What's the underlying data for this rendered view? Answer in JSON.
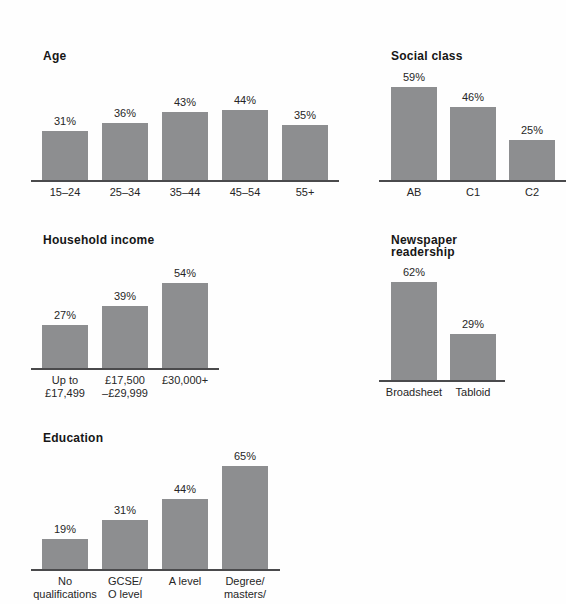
{
  "style": {
    "bar_color": "#8d8e90",
    "axis_color": "#4a4a4c",
    "text_color": "#262626",
    "title_color": "#161616",
    "background": "#fefefe"
  },
  "chart_data": [
    {
      "type": "bar",
      "title": "Age",
      "categories": [
        "15–24",
        "25–34",
        "35–44",
        "45–54",
        "55+"
      ],
      "values": [
        31,
        36,
        43,
        44,
        35
      ],
      "value_labels": [
        "31%",
        "36%",
        "43%",
        "44%",
        "35%"
      ],
      "unit": "%",
      "grid": false,
      "legend": "none"
    },
    {
      "type": "bar",
      "title": "Social class",
      "categories": [
        "AB",
        "C1",
        "C2"
      ],
      "values": [
        59,
        46,
        25
      ],
      "value_labels": [
        "59%",
        "46%",
        "25%"
      ],
      "unit": "%",
      "grid": false,
      "legend": "none"
    },
    {
      "type": "bar",
      "title": "Household income",
      "categories": [
        "Up to\n£17,499",
        "£17,500\n–£29,999",
        "£30,000+"
      ],
      "values": [
        27,
        39,
        54
      ],
      "value_labels": [
        "27%",
        "39%",
        "54%"
      ],
      "unit": "%",
      "grid": false,
      "legend": "none"
    },
    {
      "type": "bar",
      "title": "Newspaper readership",
      "categories": [
        "Broadsheet",
        "Tabloid"
      ],
      "values": [
        62,
        29
      ],
      "value_labels": [
        "62%",
        "29%"
      ],
      "unit": "%",
      "grid": false,
      "legend": "none"
    },
    {
      "type": "bar",
      "title": "Education",
      "categories": [
        "No\nqualifications",
        "GCSE/\nO level",
        "A level",
        "Degree/\nmasters/"
      ],
      "values": [
        19,
        31,
        44,
        65
      ],
      "value_labels": [
        "19%",
        "31%",
        "44%",
        "65%"
      ],
      "unit": "%",
      "grid": false,
      "legend": "none"
    }
  ]
}
